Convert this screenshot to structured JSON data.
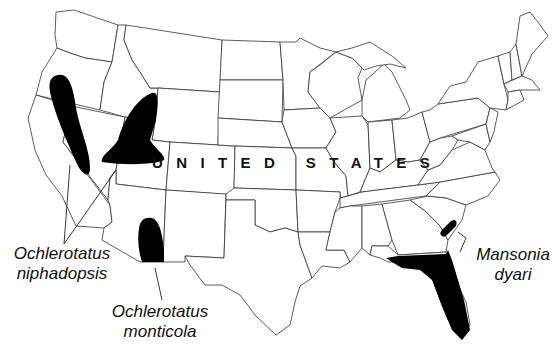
{
  "map": {
    "country_label": "UNITED STATES",
    "colors": {
      "background": "#ffffff",
      "state_border": "#333333",
      "range_fill": "#000000"
    },
    "species": [
      {
        "id": "niphadopsis",
        "genus": "Ochlerotatus",
        "epithet": "niphadopsis",
        "regions": [
          "California–Nevada–Oregon border strip",
          "Idaho–Utah–Wyoming–Nevada area"
        ]
      },
      {
        "id": "monticola",
        "genus": "Ochlerotatus",
        "epithet": "monticola",
        "regions": [
          "Southeastern Arizona / southwestern New Mexico"
        ]
      },
      {
        "id": "dyari",
        "genus": "Mansonia",
        "epithet": "dyari",
        "regions": [
          "Florida",
          "Coastal Georgia / South Carolina"
        ]
      }
    ]
  }
}
